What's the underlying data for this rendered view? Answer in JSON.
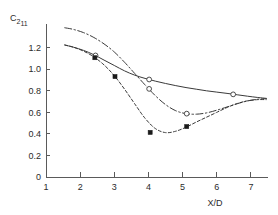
{
  "chart_data": {
    "type": "line",
    "title": "",
    "subtitle": "",
    "xlabel": "X/D",
    "ylabel": "C2 11",
    "ylabel_base": "C",
    "ylabel_sub1": "2",
    "ylabel_sub2": "11",
    "xlim": [
      1,
      7.5
    ],
    "ylim": [
      0,
      1.42
    ],
    "xticks": [
      1,
      2,
      3,
      4,
      5,
      6,
      7
    ],
    "xticklabels": [
      "1",
      "2",
      "3",
      "4",
      "5",
      "6",
      "7"
    ],
    "yticks": [
      0,
      0.2,
      0.4,
      0.6,
      0.8,
      1.0,
      1.2
    ],
    "yticklabels": [
      "0",
      "0.2",
      "0.4",
      "0.6",
      "0.8",
      "1.0",
      "1.2"
    ],
    "grid": false,
    "legend": "none",
    "legend_position": "none",
    "series": [
      {
        "name": "solid-open-circle",
        "linestyle": "solid",
        "marker": "open-circle",
        "color": "#3a3a3a",
        "x": [
          1.55,
          1.8,
          2.1,
          2.4,
          2.7,
          3.0,
          3.3,
          3.6,
          3.9,
          4.2,
          4.5,
          4.8,
          5.1,
          5.4,
          5.7,
          6.0,
          6.3,
          6.6,
          6.9,
          7.2,
          7.45
        ],
        "y": [
          1.225,
          1.205,
          1.175,
          1.135,
          1.085,
          1.035,
          0.985,
          0.945,
          0.915,
          0.89,
          0.868,
          0.848,
          0.83,
          0.815,
          0.8,
          0.788,
          0.776,
          0.763,
          0.75,
          0.738,
          0.73
        ],
        "markers_x": [
          2.45,
          4.02,
          6.48
        ],
        "markers_y": [
          1.128,
          0.905,
          0.767
        ]
      },
      {
        "name": "dashdot-open-circle",
        "linestyle": "dashdot",
        "marker": "open-circle",
        "color": "#3a3a3a",
        "x": [
          1.55,
          1.8,
          2.1,
          2.4,
          2.7,
          3.0,
          3.3,
          3.6,
          3.9,
          4.2,
          4.5,
          4.8,
          5.1,
          5.4,
          5.7,
          6.0,
          6.3,
          6.6,
          6.9,
          7.2,
          7.45
        ],
        "y": [
          1.385,
          1.37,
          1.34,
          1.295,
          1.235,
          1.16,
          1.065,
          0.96,
          0.855,
          0.755,
          0.672,
          0.615,
          0.588,
          0.583,
          0.595,
          0.62,
          0.65,
          0.68,
          0.706,
          0.722,
          0.728
        ],
        "markers_x": [
          4.02,
          5.12
        ],
        "markers_y": [
          0.818,
          0.588
        ]
      },
      {
        "name": "dashed-filled-square",
        "linestyle": "dashed",
        "marker": "filled-square",
        "color": "#3a3a3a",
        "x": [
          1.55,
          1.8,
          2.1,
          2.4,
          2.7,
          3.0,
          3.3,
          3.6,
          3.9,
          4.2,
          4.5,
          4.8,
          5.1,
          5.4,
          5.7,
          6.0,
          6.3,
          6.6,
          6.9,
          7.2,
          7.45
        ],
        "y": [
          1.225,
          1.205,
          1.168,
          1.115,
          1.04,
          0.94,
          0.815,
          0.678,
          0.545,
          0.45,
          0.412,
          0.425,
          0.462,
          0.51,
          0.555,
          0.6,
          0.645,
          0.682,
          0.707,
          0.718,
          0.718
        ],
        "markers_x": [
          2.43,
          3.02,
          4.05,
          5.12
        ],
        "markers_y": [
          1.107,
          0.932,
          0.414,
          0.468
        ]
      }
    ]
  }
}
